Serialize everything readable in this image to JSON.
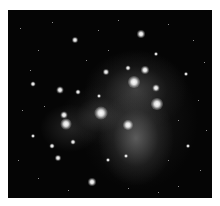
{
  "image": {
    "subject": "star cluster with reflection nebula (grayscale astrophotograph)",
    "background_color": "#ffffff",
    "sky_color": "#050505",
    "nebula_color": "#9a9a9a"
  }
}
